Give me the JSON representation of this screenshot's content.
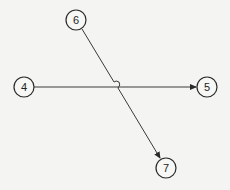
{
  "diagram": {
    "type": "directed-graph",
    "colors": {
      "background": "#f4f4f2",
      "stroke": "#2a2a2a",
      "node_fill": "#f7f7f5"
    },
    "nodes": [
      {
        "id": "4",
        "label": "4",
        "cx": 24,
        "cy": 87
      },
      {
        "id": "5",
        "label": "5",
        "cx": 207,
        "cy": 87
      },
      {
        "id": "6",
        "label": "6",
        "cx": 76,
        "cy": 20
      },
      {
        "id": "7",
        "label": "7",
        "cx": 166,
        "cy": 168
      }
    ],
    "edges": [
      {
        "from": "4",
        "to": "5",
        "arrow": "end"
      },
      {
        "from": "6",
        "to": "7",
        "arrow": "end",
        "line_hop_over": "4-5"
      }
    ]
  }
}
